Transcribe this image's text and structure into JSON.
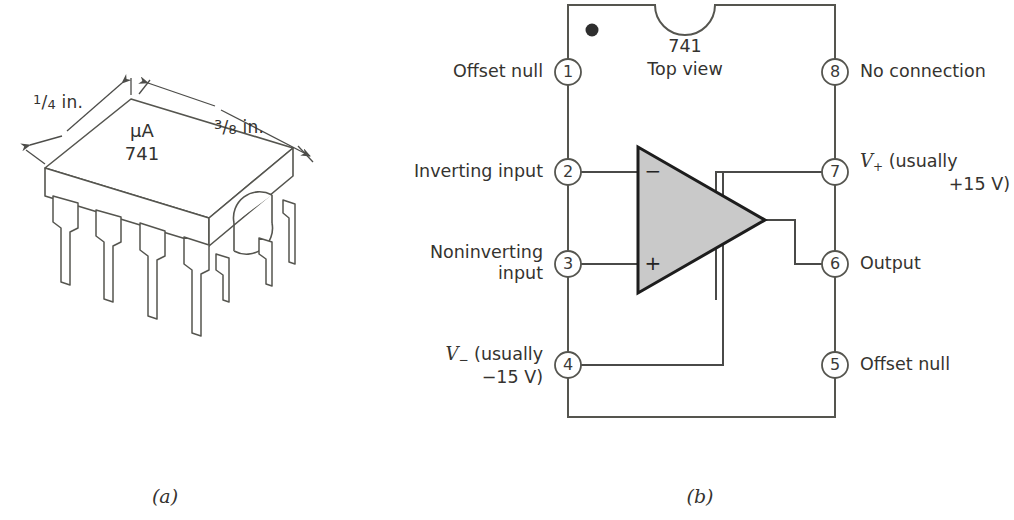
{
  "figure": {
    "panels": [
      {
        "id": "a",
        "caption": "(a)"
      },
      {
        "id": "b",
        "caption": "(b)"
      }
    ]
  },
  "package_view": {
    "dimension_width_label": {
      "numerator": "1",
      "slash": "/",
      "denominator": "4",
      "unit": " in."
    },
    "dimension_length_label": {
      "numerator": "3",
      "slash": "/",
      "denominator": "8",
      "unit": " in."
    },
    "marking_line1": "μA",
    "marking_line2": "741",
    "body_fill": "#ffffff",
    "outline_color": "#555552",
    "pin_count": 8
  },
  "top_view": {
    "device_label_line1": "741",
    "device_label_line2": "Top view",
    "body_outline_color": "#55554f",
    "triangle_fill": "#c9c9c9",
    "triangle_stroke": "#1d1d1d",
    "inverting_sign": "−",
    "noninverting_sign": "+",
    "pins_left": [
      {
        "number": "1",
        "label": "Offset null"
      },
      {
        "number": "2",
        "label": "Inverting input"
      },
      {
        "number": "3",
        "label_line1": "Noninverting",
        "label_line2": "input"
      },
      {
        "number": "4",
        "label_line1_prefix": "V",
        "label_line1_sub": "−",
        "label_line1_rest": " (usually",
        "label_line2": "−15 V)"
      }
    ],
    "pins_right": [
      {
        "number": "8",
        "label": "No connection"
      },
      {
        "number": "7",
        "label_line1_prefix": "V",
        "label_line1_sub": "+",
        "label_line1_rest": " (usually",
        "label_line2": "+15 V)"
      },
      {
        "number": "6",
        "label": "Output"
      },
      {
        "number": "5",
        "label": "Offset null"
      }
    ]
  }
}
